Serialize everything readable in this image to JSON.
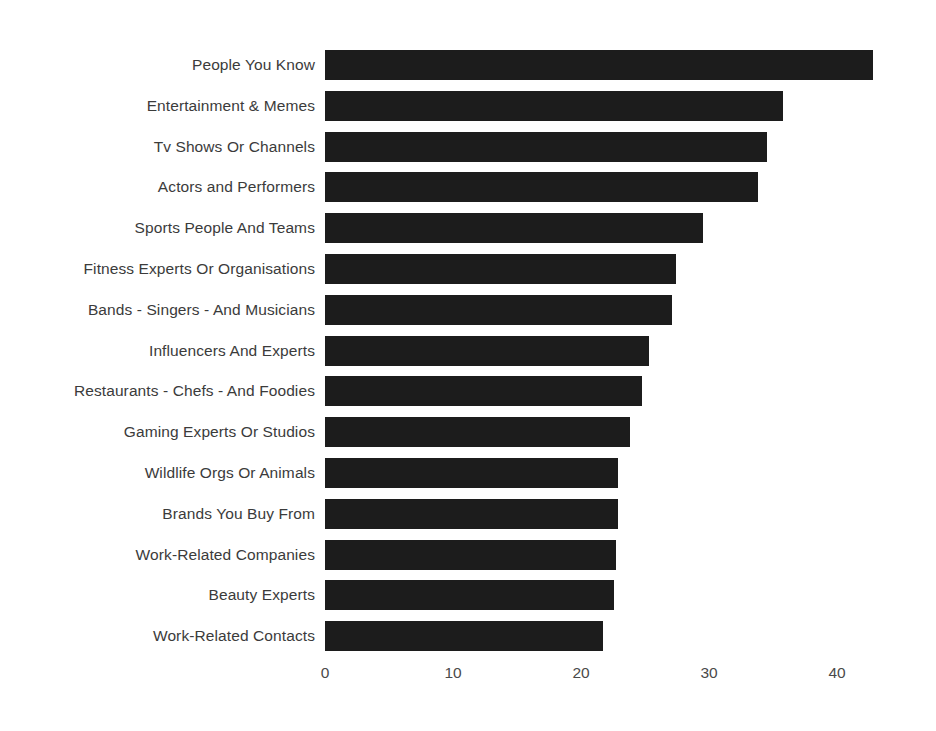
{
  "chart_data": {
    "type": "bar",
    "orientation": "horizontal",
    "title": "",
    "subtitle": "",
    "xlabel": "",
    "ylabel": "",
    "xlim": [
      0,
      46
    ],
    "grid": false,
    "legend": null,
    "bar_color": "#1c1c1c",
    "background_color": "#ffffff",
    "label_color": "#3b3b3b",
    "tick_color": "#4a4a4a",
    "xticks": [
      0,
      10,
      20,
      30,
      40
    ],
    "xtick_labels": [
      "0",
      "10",
      "20",
      "30",
      "40"
    ],
    "categories": [
      "People You Know",
      "Entertainment & Memes",
      "Tv Shows Or Channels",
      "Actors and Performers",
      "Sports People And Teams",
      "Fitness Experts Or Organisations",
      "Bands - Singers - And Musicians",
      "Influencers And Experts",
      "Restaurants - Chefs - And Foodies",
      "Gaming Experts Or Studios",
      "Wildlife Orgs Or Animals",
      "Brands You Buy From",
      "Work-Related Companies",
      "Beauty Experts",
      "Work-Related Contacts"
    ],
    "values": [
      42.8,
      35.8,
      34.5,
      33.8,
      29.5,
      27.4,
      27.1,
      25.3,
      24.8,
      23.8,
      22.9,
      22.9,
      22.7,
      22.6,
      21.7
    ]
  }
}
